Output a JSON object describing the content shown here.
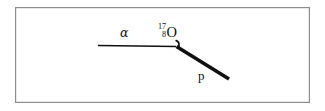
{
  "figure": {
    "type": "nuclear-reaction-track-diagram",
    "background_color": "#ffffff",
    "frame": {
      "border_color": "#8d8d8d",
      "x": 15,
      "y": 7,
      "width": 295,
      "height": 96
    },
    "ink_color": "#101010"
  },
  "labels": {
    "alpha": "α",
    "proton": "p",
    "nucleus": {
      "mass_number": "17",
      "atomic_number": "8",
      "symbol": "O"
    }
  },
  "tracks": {
    "incoming": {
      "name": "alpha-particle-track",
      "style": "thin",
      "stroke_width": 1.7,
      "x1": 98,
      "y1": 45.5,
      "x2": 176,
      "y2": 46.5
    },
    "outgoing": {
      "name": "proton-track",
      "style": "thick",
      "stroke_width": 3.6,
      "x1": 176.5,
      "y1": 46.5,
      "x2": 229,
      "y2": 79
    },
    "vertex_tick": {
      "name": "interaction-vertex-tick",
      "stroke_width": 1.6,
      "x1": 176.5,
      "y1": 41,
      "x2": 178.5,
      "y2": 45.5
    },
    "vertex": {
      "x": 176.5,
      "y": 46.5
    }
  }
}
